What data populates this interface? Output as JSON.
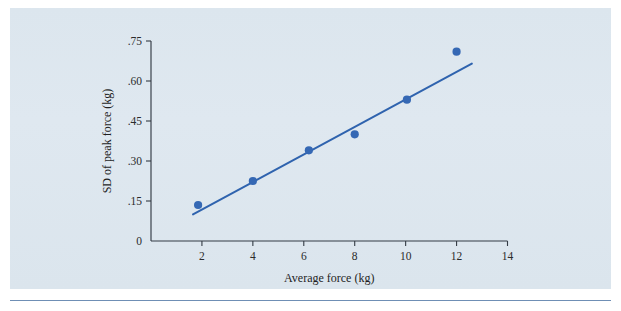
{
  "figure": {
    "background_color": "#dde7ef",
    "page_color": "#ffffff",
    "rule_color": "#6f8fb5"
  },
  "chart_data": {
    "type": "scatter",
    "title": "",
    "subtitle": "",
    "xlabel": "Average force (kg)",
    "ylabel": "SD of peak force (kg)",
    "xlim": [
      0,
      14
    ],
    "ylim": [
      0,
      0.75
    ],
    "grid": false,
    "legend": "none",
    "marker_color": "#3568b4",
    "line_color": "#2f63ae",
    "xticks": [
      2,
      4,
      6,
      8,
      10,
      12,
      14
    ],
    "xtick_labels": [
      "2",
      "4",
      "6",
      "8",
      "10",
      "12",
      "14"
    ],
    "yticks": [
      0,
      0.15,
      0.3,
      0.45,
      0.6,
      0.75
    ],
    "ytick_labels": [
      "0",
      ".15",
      ".30",
      ".45",
      ".60",
      ".75"
    ],
    "x": [
      1.85,
      4.0,
      6.2,
      8.0,
      10.05,
      12.0
    ],
    "y": [
      0.135,
      0.225,
      0.34,
      0.4,
      0.53,
      0.71
    ],
    "points": [
      {
        "x": 1.85,
        "y": 0.135
      },
      {
        "x": 4.0,
        "y": 0.225
      },
      {
        "x": 6.2,
        "y": 0.34
      },
      {
        "x": 8.0,
        "y": 0.4
      },
      {
        "x": 10.05,
        "y": 0.53
      },
      {
        "x": 12.0,
        "y": 0.71
      }
    ],
    "fit_line": {
      "x_start": 1.65,
      "y_start": 0.1,
      "x_end": 12.6,
      "y_end": 0.665
    }
  }
}
